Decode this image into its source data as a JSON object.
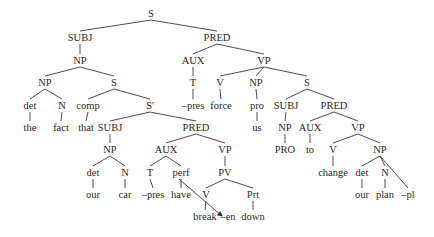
{
  "diagram": {
    "type": "syntax-tree",
    "nodes": [
      {
        "id": "n0",
        "label": "S",
        "x": 151,
        "y": 17
      },
      {
        "id": "n1",
        "label": "SUBJ",
        "x": 80,
        "y": 41
      },
      {
        "id": "n2",
        "label": "PRED",
        "x": 217,
        "y": 41
      },
      {
        "id": "n3",
        "label": "NP",
        "x": 80,
        "y": 64
      },
      {
        "id": "n4",
        "label": "AUX",
        "x": 193,
        "y": 64
      },
      {
        "id": "n5",
        "label": "VP",
        "x": 264,
        "y": 64
      },
      {
        "id": "n6",
        "label": "NP",
        "x": 45,
        "y": 86
      },
      {
        "id": "n7",
        "label": "S",
        "x": 114,
        "y": 86
      },
      {
        "id": "n8",
        "label": "T",
        "x": 193,
        "y": 86
      },
      {
        "id": "n9",
        "label": "V",
        "x": 220,
        "y": 86
      },
      {
        "id": "n10",
        "label": "NP",
        "x": 256,
        "y": 86
      },
      {
        "id": "n11",
        "label": "S",
        "x": 307,
        "y": 86
      },
      {
        "id": "n12",
        "label": "det",
        "x": 30,
        "y": 109
      },
      {
        "id": "n13",
        "label": "N",
        "x": 62,
        "y": 109
      },
      {
        "id": "n14",
        "label": "comp",
        "x": 88,
        "y": 109
      },
      {
        "id": "n15",
        "label": "S'",
        "x": 150,
        "y": 109
      },
      {
        "id": "n16",
        "label": "–pres",
        "x": 193,
        "y": 109
      },
      {
        "id": "n17",
        "label": "force",
        "x": 221,
        "y": 109
      },
      {
        "id": "n18",
        "label": "pro",
        "x": 257,
        "y": 109
      },
      {
        "id": "n19",
        "label": "SUBJ",
        "x": 286,
        "y": 109
      },
      {
        "id": "n20",
        "label": "PRED",
        "x": 334,
        "y": 109
      },
      {
        "id": "n21",
        "label": "the",
        "x": 30,
        "y": 131
      },
      {
        "id": "n22",
        "label": "fact",
        "x": 61,
        "y": 131
      },
      {
        "id": "n23",
        "label": "that",
        "x": 86,
        "y": 131
      },
      {
        "id": "n24",
        "label": "SUBJ",
        "x": 110,
        "y": 131
      },
      {
        "id": "n25",
        "label": "PRED",
        "x": 196,
        "y": 131
      },
      {
        "id": "n26",
        "label": "us",
        "x": 257,
        "y": 131
      },
      {
        "id": "n27",
        "label": "NP",
        "x": 285,
        "y": 131
      },
      {
        "id": "n28",
        "label": "AUX",
        "x": 310,
        "y": 131
      },
      {
        "id": "n29",
        "label": "VP",
        "x": 358,
        "y": 131
      },
      {
        "id": "n30",
        "label": "NP",
        "x": 110,
        "y": 153
      },
      {
        "id": "n31",
        "label": "AUX",
        "x": 166,
        "y": 153
      },
      {
        "id": "n32",
        "label": "VP",
        "x": 225,
        "y": 153
      },
      {
        "id": "n33",
        "label": "PRO",
        "x": 285,
        "y": 153
      },
      {
        "id": "n34",
        "label": "to",
        "x": 310,
        "y": 153
      },
      {
        "id": "n35",
        "label": "V",
        "x": 333,
        "y": 153
      },
      {
        "id": "n36",
        "label": "NP",
        "x": 380,
        "y": 153
      },
      {
        "id": "n37",
        "label": "det",
        "x": 93,
        "y": 176
      },
      {
        "id": "n38",
        "label": "N",
        "x": 125,
        "y": 176
      },
      {
        "id": "n39",
        "label": "T",
        "x": 150,
        "y": 176
      },
      {
        "id": "n40",
        "label": "perf",
        "x": 181,
        "y": 176
      },
      {
        "id": "n41",
        "label": "PV",
        "x": 225,
        "y": 176
      },
      {
        "id": "n42",
        "label": "change",
        "x": 333,
        "y": 176
      },
      {
        "id": "n43",
        "label": "det",
        "x": 362,
        "y": 176
      },
      {
        "id": "n44",
        "label": "N",
        "x": 385,
        "y": 176
      },
      {
        "id": "n45",
        "label": "our",
        "x": 93,
        "y": 198
      },
      {
        "id": "n46",
        "label": "car",
        "x": 125,
        "y": 198
      },
      {
        "id": "n47",
        "label": "–pres",
        "x": 153,
        "y": 198
      },
      {
        "id": "n48",
        "label": "have",
        "x": 181,
        "y": 198
      },
      {
        "id": "n49",
        "label": "V",
        "x": 206,
        "y": 198
      },
      {
        "id": "n50",
        "label": "Prt",
        "x": 253,
        "y": 198
      },
      {
        "id": "n51",
        "label": "our",
        "x": 362,
        "y": 198
      },
      {
        "id": "n52",
        "label": "plan",
        "x": 385,
        "y": 198
      },
      {
        "id": "n53",
        "label": "–pl",
        "x": 408,
        "y": 198
      },
      {
        "id": "n54",
        "label": "break",
        "x": 205,
        "y": 220
      },
      {
        "id": "n55",
        "label": "–en",
        "x": 228,
        "y": 220
      },
      {
        "id": "n56",
        "label": "down",
        "x": 253,
        "y": 220
      }
    ],
    "edges": [
      [
        "n0",
        "n1"
      ],
      [
        "n0",
        "n2"
      ],
      [
        "n1",
        "n3"
      ],
      [
        "n2",
        "n4"
      ],
      [
        "n2",
        "n5"
      ],
      [
        "n3",
        "n6"
      ],
      [
        "n3",
        "n7"
      ],
      [
        "n4",
        "n8"
      ],
      [
        "n5",
        "n9"
      ],
      [
        "n5",
        "n10"
      ],
      [
        "n5",
        "n11"
      ],
      [
        "n6",
        "n12"
      ],
      [
        "n6",
        "n13"
      ],
      [
        "n7",
        "n14"
      ],
      [
        "n7",
        "n15"
      ],
      [
        "n8",
        "n16"
      ],
      [
        "n9",
        "n17"
      ],
      [
        "n10",
        "n18"
      ],
      [
        "n11",
        "n19"
      ],
      [
        "n11",
        "n20"
      ],
      [
        "n12",
        "n21"
      ],
      [
        "n13",
        "n22"
      ],
      [
        "n14",
        "n23"
      ],
      [
        "n15",
        "n24"
      ],
      [
        "n15",
        "n25"
      ],
      [
        "n18",
        "n26"
      ],
      [
        "n19",
        "n27"
      ],
      [
        "n20",
        "n28"
      ],
      [
        "n20",
        "n29"
      ],
      [
        "n24",
        "n30"
      ],
      [
        "n25",
        "n31"
      ],
      [
        "n25",
        "n32"
      ],
      [
        "n27",
        "n33"
      ],
      [
        "n28",
        "n34"
      ],
      [
        "n29",
        "n35"
      ],
      [
        "n29",
        "n36"
      ],
      [
        "n30",
        "n37"
      ],
      [
        "n30",
        "n38"
      ],
      [
        "n31",
        "n39"
      ],
      [
        "n31",
        "n40"
      ],
      [
        "n32",
        "n41"
      ],
      [
        "n35",
        "n42"
      ],
      [
        "n36",
        "n43"
      ],
      [
        "n36",
        "n44"
      ],
      [
        "n36",
        "n53"
      ],
      [
        "n37",
        "n45"
      ],
      [
        "n38",
        "n46"
      ],
      [
        "n39",
        "n47"
      ],
      [
        "n40",
        "n48"
      ],
      [
        "n41",
        "n49"
      ],
      [
        "n41",
        "n50"
      ],
      [
        "n43",
        "n51"
      ],
      [
        "n44",
        "n52"
      ],
      [
        "n49",
        "n54"
      ],
      [
        "n50",
        "n56"
      ]
    ],
    "movement_arrows": [
      {
        "from": "n40",
        "to": "n55",
        "description": "affix hopping: perf to -en"
      }
    ]
  }
}
